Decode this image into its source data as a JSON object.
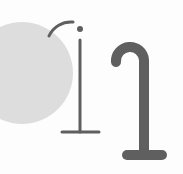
{
  "illustration": {
    "description": "Abstract graphic: grey circle with thin and thick cane-like hook shapes",
    "colors": {
      "background": "#fdfdfd",
      "circle": "#dddddd",
      "stroke": "#5f5f5f"
    },
    "shapes": [
      "circle",
      "thin-hook-with-dot",
      "thick-cane-hook"
    ]
  }
}
